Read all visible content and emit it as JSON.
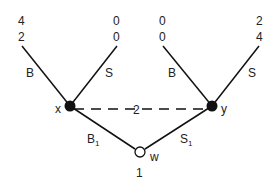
{
  "diagram": {
    "type": "game-tree",
    "nodes": {
      "x": {
        "label": "x",
        "cx": 70,
        "cy": 106,
        "style": "filled"
      },
      "y": {
        "label": "y",
        "cx": 212,
        "cy": 106,
        "style": "filled"
      },
      "w": {
        "label": "w",
        "cx": 140,
        "cy": 152,
        "style": "hollow",
        "sublabel": "1"
      }
    },
    "edges": {
      "x_B": {
        "label": "B"
      },
      "x_S": {
        "label": "S"
      },
      "y_B": {
        "label": "B"
      },
      "y_S": {
        "label": "S"
      },
      "w_B1": {
        "label": "B",
        "sub": "1"
      },
      "w_S1": {
        "label": "S",
        "sub": "1"
      },
      "info_set": {
        "label": "2",
        "style": "dashed"
      }
    },
    "payoffs": [
      {
        "top": "4",
        "bottom": "2"
      },
      {
        "top": "0",
        "bottom": "0"
      },
      {
        "top": "0",
        "bottom": "0"
      },
      {
        "top": "2",
        "bottom": "4"
      }
    ]
  }
}
